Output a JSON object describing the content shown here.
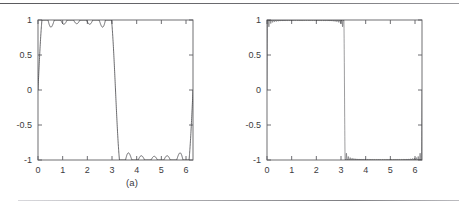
{
  "figure": {
    "caption_a": "(a)",
    "caption_b": "(b)",
    "has_top_rule": true,
    "has_bottom_rule": true,
    "line_color": "#3a3a3e",
    "axis_color": "#5f5f63",
    "background": "#ffffff"
  },
  "chart_data": [
    {
      "id": "panel-a",
      "type": "line",
      "title": "",
      "subtitle": "",
      "xlabel": "",
      "ylabel": "",
      "xlim": [
        0,
        6.2832
      ],
      "ylim": [
        -1,
        1
      ],
      "grid": false,
      "legend": null,
      "x_ticks": [
        0,
        1,
        2,
        3,
        4,
        5,
        6
      ],
      "x_tick_labels": [
        "0",
        "1",
        "2",
        "3",
        "4",
        "5",
        "6"
      ],
      "y_ticks": [
        -1,
        -0.5,
        0,
        0.5,
        1
      ],
      "y_tick_labels": [
        "-1",
        "-0.5",
        "0",
        "0.5",
        "1"
      ],
      "description": "Fourier partial sum of a square wave, low harmonic count; visible Gibbs ripples",
      "series": [
        {
          "name": "partial-sum-low-order",
          "kind": "square-wave-fourier-partial-sum",
          "n_harmonics": 11,
          "amplitude": 1,
          "period": 6.2832,
          "overshoot_peak": 0.94,
          "plateau_level": 0.78,
          "jump_locations": [
            0,
            3.1416,
            6.2832
          ]
        }
      ]
    },
    {
      "id": "panel-b",
      "type": "line",
      "title": "",
      "subtitle": "",
      "xlabel": "",
      "ylabel": "",
      "xlim": [
        0,
        6.2832
      ],
      "ylim": [
        -1,
        1
      ],
      "grid": false,
      "legend": null,
      "x_ticks": [
        0,
        1,
        2,
        3,
        4,
        5,
        6
      ],
      "x_tick_labels": [
        "0",
        "1",
        "2",
        "3",
        "4",
        "5",
        "6"
      ],
      "y_ticks": [
        -1,
        -0.5,
        0,
        0.5,
        1
      ],
      "y_tick_labels": [
        "-1",
        "-0.5",
        "0",
        "0.5",
        "1"
      ],
      "description": "Fourier partial sum of a square wave, high harmonic count; ripples compress into a dense band with edge spikes",
      "series": [
        {
          "name": "partial-sum-high-order",
          "kind": "square-wave-fourier-partial-sum",
          "n_harmonics": 81,
          "amplitude": 1,
          "period": 6.2832,
          "overshoot_peak": 0.94,
          "plateau_level": 0.78,
          "jump_locations": [
            0,
            3.1416,
            6.2832
          ]
        }
      ]
    }
  ]
}
